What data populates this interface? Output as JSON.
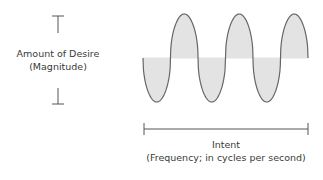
{
  "magnitude_label": {
    "line1": "Amount of Desire",
    "line2": "(Magnitude)"
  },
  "frequency_label": {
    "line1": "Intent",
    "line2": "(Frequency; in cycles per second)"
  },
  "wave": {
    "cycles": 3,
    "fill_color": "#e3e3e3",
    "stroke_color": "#666666"
  }
}
